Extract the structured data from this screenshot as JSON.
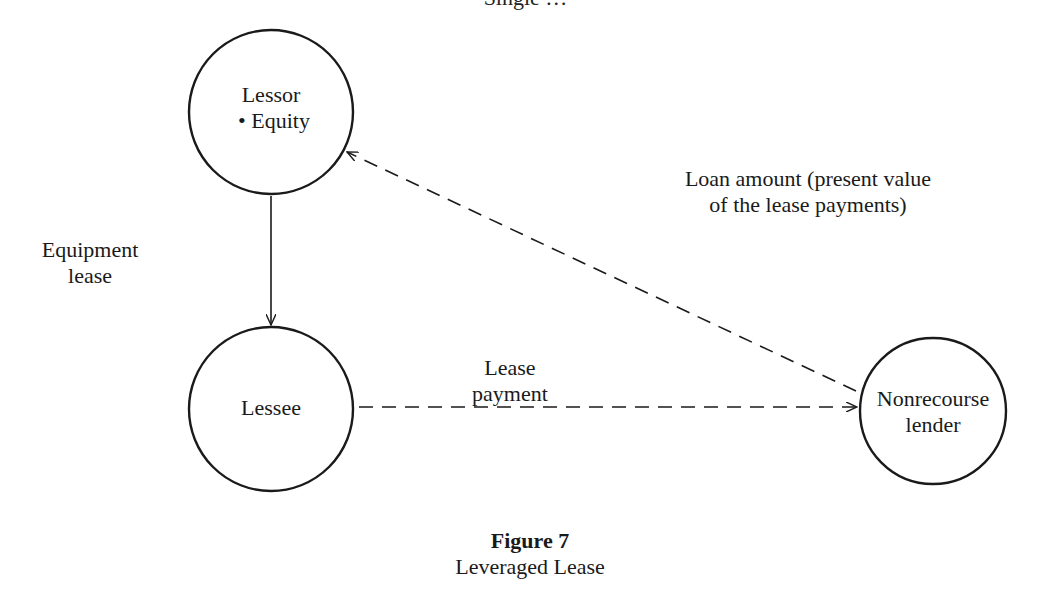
{
  "header": {
    "running_title_clipped": "Single …"
  },
  "nodes": {
    "lessor": {
      "title": "Lessor",
      "bullet": "•",
      "item": "Equity"
    },
    "lessee": {
      "title": "Lessee"
    },
    "lender": {
      "line1": "Nonrecourse",
      "line2": "lender"
    }
  },
  "edges": {
    "equipment_lease": {
      "line1": "Equipment",
      "line2": "lease",
      "style": "solid",
      "from": "Lessor",
      "to": "Lessee"
    },
    "lease_payment": {
      "line1": "Lease",
      "line2": "payment",
      "style": "dashed",
      "from": "Lessee",
      "to": "Nonrecourse lender"
    },
    "loan_amount": {
      "line1": "Loan amount (present value",
      "line2": "of the lease payments)",
      "style": "dashed",
      "from": "Nonrecourse lender",
      "to": "Lessor"
    }
  },
  "caption": {
    "number": "Figure 7",
    "title": "Leveraged Lease"
  },
  "colors": {
    "ink": "#1a1a1a",
    "background": "#ffffff"
  }
}
